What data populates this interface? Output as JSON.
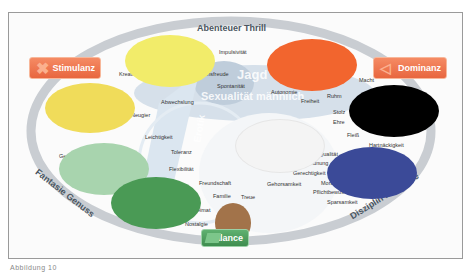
{
  "diagram": {
    "outer_ring_labels": {
      "top": "Abenteuer Thrill",
      "left": "Fantasie Genuss",
      "right": "Disziplin Kontrolle"
    },
    "buttons": {
      "stimulanz": "Stimulanz",
      "dominanz": "Dominanz",
      "balance": "Balance"
    },
    "zone_labels": {
      "jagd": "Jagd",
      "sexualitaet": "Sexualität männlich",
      "erotik": "Erotik"
    },
    "terms": {
      "impulsivitaet": "Impulsivität",
      "kreativitaet": "Kreativität",
      "lebensfreude": "Lebensfreude",
      "spontanitaet": "Spontanität",
      "abwechslung": "Abwechslung",
      "neugier": "Neugier",
      "autonomie": "Autonomie",
      "freiheit": "Freiheit",
      "macht": "Macht",
      "ruhm": "Ruhm",
      "stolz": "Stolz",
      "ehre": "Ehre",
      "fleiss": "Fleiß",
      "hartnaeckigkeit": "Hartnäckigkeit",
      "leichtigkeit": "Leichtigkeit",
      "toleranz": "Toleranz",
      "flexibilitaet": "Flexibilität",
      "freundschaft": "Freundschaft",
      "familie": "Familie",
      "treue": "Treue",
      "heimat": "Heimat",
      "nostalgie": "Nostalgie",
      "gehorsamkeit": "Gehorsamkeit",
      "gerechtigkeit": "Gerechtigkeit",
      "qualitaet": "Qualität",
      "ordnung": "Ordnung",
      "moral": "Moral",
      "pflichtbewusstsein": "Pflichtbewusstsein",
      "sparsamkeit": "Sparsamkeit",
      "genuss_left": "Genuss",
      "gesundheit": "Geborgenheit",
      "natur": "Natur"
    },
    "blobs": {
      "yellow_top": "#f2ec6a",
      "yellow_left": "#f0dc5a",
      "orange": "#f2652e",
      "black": "#000000",
      "white": "#f4f4f4",
      "navy": "#3b4a98",
      "light_green": "#a8d4ae",
      "green": "#4a9a55",
      "brown": "#a2734a"
    }
  },
  "caption": "Abbildung 10"
}
